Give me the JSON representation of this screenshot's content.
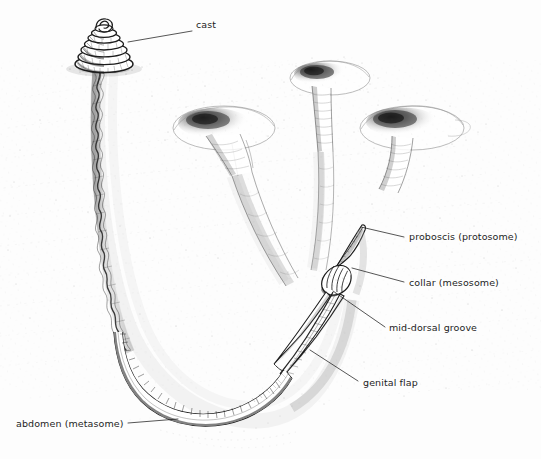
{
  "figure": {
    "background_color": "#fdfdfd",
    "ink_color": "#1d1d1d",
    "style": "pen-and-ink stipple scientific illustration"
  },
  "labels": [
    {
      "id": "cast",
      "text": "cast",
      "x": 196,
      "y": 25,
      "anchor": "left",
      "leader": {
        "from_x": 192,
        "from_y": 31,
        "to_x": 128,
        "to_y": 42
      }
    },
    {
      "id": "proboscis",
      "text": "proboscis (protosome)",
      "x": 409,
      "y": 231,
      "anchor": "left",
      "leader": {
        "from_x": 404,
        "from_y": 237,
        "to_x": 361,
        "to_y": 227
      }
    },
    {
      "id": "collar",
      "text": "collar (mesosome)",
      "x": 409,
      "y": 277,
      "anchor": "left",
      "leader": {
        "from_x": 404,
        "from_y": 282,
        "to_x": 352,
        "to_y": 268
      }
    },
    {
      "id": "mid-dorsal-groove",
      "text": "mid-dorsal groove",
      "x": 389,
      "y": 322,
      "anchor": "left",
      "leader": {
        "from_x": 385,
        "from_y": 327,
        "to_x": 333,
        "to_y": 291
      }
    },
    {
      "id": "genital-flap",
      "text": "genital flap",
      "x": 363,
      "y": 377,
      "anchor": "left",
      "leader": {
        "from_x": 358,
        "from_y": 381,
        "to_x": 310,
        "to_y": 350
      }
    },
    {
      "id": "abdomen",
      "text": "abdomen (metasome)",
      "x": 16,
      "y": 418,
      "anchor": "left",
      "leader": {
        "from_x": 128,
        "from_y": 423,
        "to_x": 178,
        "to_y": 419
      }
    }
  ],
  "structures": [
    {
      "id": "cast-coil",
      "name": "fecal cast coil",
      "cx": 103,
      "cy": 45
    },
    {
      "id": "cast-stalk",
      "name": "wavy burrow stalk",
      "cx": 98,
      "cy": 180
    },
    {
      "id": "funnel-left",
      "name": "burrow funnel opening left",
      "cx": 222,
      "cy": 130
    },
    {
      "id": "funnel-top",
      "name": "burrow funnel opening top",
      "cx": 327,
      "cy": 82
    },
    {
      "id": "funnel-right",
      "name": "burrow funnel opening right",
      "cx": 408,
      "cy": 130
    },
    {
      "id": "worm-body",
      "name": "acorn worm body",
      "cx": 300,
      "cy": 300
    },
    {
      "id": "burrow-u-tube",
      "name": "U-shaped burrow tube",
      "cx": 210,
      "cy": 330
    },
    {
      "id": "sediment",
      "name": "sediment strata stipple",
      "cx": 270,
      "cy": 230
    }
  ]
}
